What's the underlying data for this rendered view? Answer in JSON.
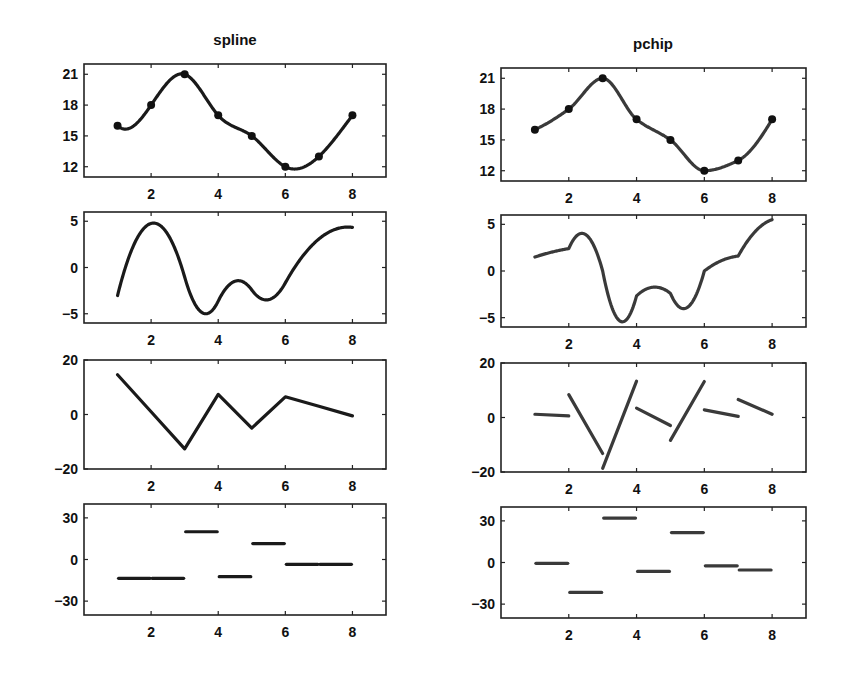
{
  "figure": {
    "columns": [
      {
        "title": "spline",
        "method": "spline"
      },
      {
        "title": "pchip",
        "method": "pchip"
      }
    ]
  },
  "chart_data": [
    {
      "type": "line",
      "title": "spline",
      "panel": "interpolant",
      "x": [
        1,
        2,
        3,
        4,
        5,
        6,
        7,
        8
      ],
      "y": [
        16,
        18,
        21,
        17,
        15,
        12,
        13,
        17
      ],
      "markers": true,
      "xlim": [
        0,
        9
      ],
      "ylim": [
        11,
        22
      ],
      "xticks": [
        2,
        4,
        6,
        8
      ],
      "yticks": [
        12,
        15,
        18,
        21
      ]
    },
    {
      "type": "line",
      "title": "",
      "panel": "first derivative (spline)",
      "approx_values": {
        "x": [
          1,
          2.05,
          3,
          3.6,
          4,
          4.6,
          5.4,
          6,
          7,
          8
        ],
        "y": [
          -3,
          4.8,
          0.5,
          -5.1,
          -3.5,
          -1.5,
          -3.7,
          -1.5,
          2.8,
          4.1
        ]
      },
      "xlim": [
        0,
        9
      ],
      "ylim": [
        -6,
        6
      ],
      "xticks": [
        2,
        4,
        6,
        8
      ],
      "yticks": [
        -5,
        0,
        5
      ]
    },
    {
      "type": "line",
      "title": "",
      "panel": "second derivative (spline)",
      "x": [
        1,
        3,
        4,
        5,
        6,
        8
      ],
      "y": [
        14,
        -13,
        7,
        -5.5,
        6,
        -1
      ],
      "xlim": [
        0,
        9
      ],
      "ylim": [
        -20,
        20
      ],
      "xticks": [
        2,
        4,
        6,
        8
      ],
      "yticks": [
        -20,
        0,
        20
      ]
    },
    {
      "type": "line",
      "title": "",
      "panel": "third derivative (spline), piecewise constant",
      "segments": [
        [
          1,
          2,
          -13.5
        ],
        [
          2,
          3,
          -13.5
        ],
        [
          3,
          4,
          20
        ],
        [
          4,
          5,
          -12.5
        ],
        [
          5,
          6,
          11.5
        ],
        [
          6,
          7,
          -5
        ],
        [
          7,
          8,
          -5
        ]
      ],
      "xlim": [
        0,
        9
      ],
      "ylim": [
        -40,
        40
      ],
      "xticks": [
        2,
        4,
        6,
        8
      ],
      "yticks": [
        -30,
        0,
        30
      ]
    },
    {
      "type": "line",
      "title": "pchip",
      "panel": "interpolant",
      "x": [
        1,
        2,
        3,
        4,
        5,
        6,
        7,
        8
      ],
      "y": [
        16,
        18,
        21,
        17,
        15,
        12,
        13,
        17
      ],
      "markers": true,
      "xlim": [
        0,
        9
      ],
      "ylim": [
        11,
        22
      ],
      "xticks": [
        2,
        4,
        6,
        8
      ],
      "yticks": [
        12,
        15,
        18,
        21
      ]
    },
    {
      "type": "line",
      "title": "",
      "panel": "first derivative (pchip)",
      "approx_values": {
        "x": [
          1,
          2,
          2.4,
          3,
          3.6,
          4,
          4.6,
          5,
          5.4,
          6,
          7,
          8
        ],
        "y": [
          1.5,
          2.4,
          4,
          0.5,
          -5.5,
          -2.7,
          -1.8,
          -2.5,
          -4.2,
          -0.2,
          1.4,
          5.3
        ]
      },
      "xlim": [
        0,
        9
      ],
      "ylim": [
        -6,
        6
      ],
      "xticks": [
        2,
        4,
        6,
        8
      ],
      "yticks": [
        -5,
        0,
        5
      ]
    },
    {
      "type": "line",
      "title": "",
      "panel": "second derivative (pchip), piecewise linear discontinuous",
      "segments": [
        [
          1,
          1,
          2,
          0.3
        ],
        [
          2,
          8,
          3,
          -13.5
        ],
        [
          3,
          -18.5,
          4,
          12.5
        ],
        [
          4,
          3,
          5,
          -3.5
        ],
        [
          5,
          -8.5,
          6,
          12
        ],
        [
          6,
          2,
          7,
          -0.5
        ],
        [
          7,
          5.5,
          8,
          0.5
        ]
      ],
      "xlim": [
        0,
        9
      ],
      "ylim": [
        -20,
        20
      ],
      "xticks": [
        2,
        4,
        6,
        8
      ],
      "yticks": [
        -20,
        0,
        20
      ]
    },
    {
      "type": "line",
      "title": "",
      "panel": "third derivative (pchip), piecewise constant",
      "segments": [
        [
          1,
          2,
          0
        ],
        [
          2,
          3,
          -22
        ],
        [
          3,
          4,
          31
        ],
        [
          4,
          5,
          -7
        ],
        [
          5,
          6,
          20
        ],
        [
          6,
          7,
          -4
        ],
        [
          7,
          8,
          -7
        ]
      ],
      "xlim": [
        0,
        9
      ],
      "ylim": [
        -40,
        40
      ],
      "xticks": [
        2,
        4,
        6,
        8
      ],
      "yticks": [
        -30,
        0,
        30
      ]
    }
  ],
  "layout": {
    "left": {
      "x0": 84,
      "x1": 386,
      "rows": [
        [
          64,
          177
        ],
        [
          212,
          323
        ],
        [
          360,
          469
        ],
        [
          504,
          615
        ]
      ]
    },
    "right": {
      "x0": 501,
      "x1": 806,
      "rows": [
        [
          68,
          181
        ],
        [
          215,
          327
        ],
        [
          363,
          472
        ],
        [
          507,
          618
        ]
      ]
    }
  }
}
